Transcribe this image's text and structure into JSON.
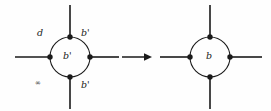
{
  "figure": {
    "name": "graph-vertex-relabel-figure",
    "background_color": "#fefefe",
    "stroke_color": "#1a1a1a",
    "text_color": "#1a1a1a",
    "transition": {
      "name": "implies-arrow",
      "glyph": "arrow-right-icon"
    }
  },
  "left_graph": {
    "name": "left-graph",
    "center_label": "b'",
    "edge_labels": {
      "top_left": "d",
      "top_right": "b'",
      "bottom_left": "∞",
      "bottom_right": "b'"
    },
    "nodes": [
      {
        "name": "node-top",
        "position": "top"
      },
      {
        "name": "node-right",
        "position": "right"
      },
      {
        "name": "node-bottom",
        "position": "bottom"
      },
      {
        "name": "node-left",
        "position": "left"
      }
    ]
  },
  "right_graph": {
    "name": "right-graph",
    "center_label": "b",
    "edge_labels": {},
    "nodes": [
      {
        "name": "node-top",
        "position": "top"
      },
      {
        "name": "node-right",
        "position": "right"
      },
      {
        "name": "node-bottom",
        "position": "bottom"
      },
      {
        "name": "node-left",
        "position": "left"
      }
    ]
  }
}
